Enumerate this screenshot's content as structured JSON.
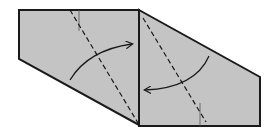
{
  "diagram": {
    "type": "origami-fold-step",
    "colors": {
      "paper": "#c4c4c4",
      "outline": "#1a1a1a",
      "background": "#ffffff"
    },
    "panels": [
      {
        "name": "left-panel",
        "points": "19,10 139,10 139,125 19,59"
      },
      {
        "name": "right-panel",
        "points": "139,10 260,77 260,126 139,126"
      }
    ],
    "fold_lines": [
      {
        "name": "left-valley-fold-line",
        "x1": 70,
        "y1": 10,
        "x2": 138,
        "y2": 123
      },
      {
        "name": "right-valley-fold-line",
        "x1": 143,
        "y1": 18,
        "x2": 206,
        "y2": 122
      }
    ],
    "edge_lines": [
      {
        "name": "left-inner-edge",
        "x1": 79,
        "y1": 10,
        "x2": 79,
        "y2": 31
      },
      {
        "name": "right-inner-edge",
        "x1": 200,
        "y1": 103,
        "x2": 200,
        "y2": 126
      }
    ],
    "arrows": [
      {
        "name": "left-fold-arrow",
        "path": "M70,80 Q88,50 132,44",
        "direction": "right"
      },
      {
        "name": "right-fold-arrow",
        "path": "M209,56 Q195,88 145,90",
        "direction": "left"
      }
    ]
  }
}
